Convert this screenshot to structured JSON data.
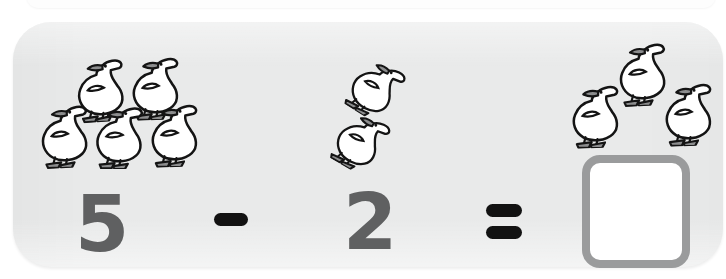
{
  "card": {
    "name": "subtraction-problem-card",
    "background_color": "#e9eaea",
    "shape": "rounded-rectangle"
  },
  "problem": {
    "type": "subtraction",
    "minuend": "5",
    "operator_minus": "−",
    "subtrahend": "2",
    "equals": "=",
    "answer": "",
    "answer_placeholder": ""
  },
  "groups": [
    {
      "id": "minuend-group",
      "label": "5",
      "count": 5,
      "icon": "duck-icon",
      "rows": [
        2,
        3
      ]
    },
    {
      "id": "subtrahend-group",
      "label": "2",
      "count": 2,
      "icon": "duck-icon",
      "rows": [
        1,
        1
      ]
    },
    {
      "id": "answer-group",
      "label": "3",
      "count": 3,
      "icon": "duck-icon",
      "rows": [
        1,
        2
      ]
    }
  ],
  "answer_box": {
    "name": "answer-input-box",
    "value": "",
    "border_color": "#9a9b9c",
    "fill_color": "#ffffff"
  },
  "colors": {
    "card_background": "#e9eaea",
    "page_background": "#ffffff",
    "numeral": "#5f6061",
    "operator": "#121212",
    "duck_body": "#ffffff",
    "duck_outline": "#141414",
    "duck_detail": "#8c8d8e",
    "answer_box_border": "#9a9b9c"
  },
  "icons": {
    "duck": "duck-icon"
  },
  "duck_positions": {
    "minuend": [
      {
        "name": "duck-icon-1",
        "x": 50,
        "y": 26,
        "rot": -4,
        "flip": false,
        "scale": 1.0
      },
      {
        "name": "duck-icon-2",
        "x": 105,
        "y": 24,
        "rot": -2,
        "flip": false,
        "scale": 1.0
      },
      {
        "name": "duck-icon-3",
        "x": 14,
        "y": 72,
        "rot": -3,
        "flip": false,
        "scale": 1.0
      },
      {
        "name": "duck-icon-4",
        "x": 69,
        "y": 73,
        "rot": 0,
        "flip": false,
        "scale": 1.0
      },
      {
        "name": "duck-icon-5",
        "x": 124,
        "y": 71,
        "rot": -2,
        "flip": false,
        "scale": 1.0
      }
    ],
    "subtrahend": [
      {
        "name": "duck-icon-6",
        "x": 327,
        "y": 25,
        "rot": 32,
        "flip": false,
        "scale": 0.92
      },
      {
        "name": "duck-icon-7",
        "x": 312,
        "y": 78,
        "rot": 30,
        "flip": false,
        "scale": 0.92
      }
    ],
    "answer": [
      {
        "name": "duck-icon-8",
        "x": 592,
        "y": 10,
        "rot": -3,
        "flip": false,
        "scale": 1.0
      },
      {
        "name": "duck-icon-9",
        "x": 545,
        "y": 52,
        "rot": -2,
        "flip": false,
        "scale": 1.0
      },
      {
        "name": "duck-icon-10",
        "x": 638,
        "y": 50,
        "rot": -2,
        "flip": false,
        "scale": 1.0
      }
    ]
  },
  "glyph_positions": {
    "minuend_numeral": {
      "x": 62,
      "y": 163
    },
    "minus": {
      "x": 201,
      "y": 191
    },
    "subtrahend_numeral": {
      "x": 330,
      "y": 161
    },
    "equals": {
      "x": 473,
      "y": 182
    }
  }
}
